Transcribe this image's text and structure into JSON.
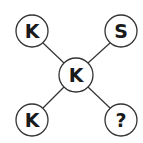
{
  "diagram": {
    "title": "",
    "nodes": [
      {
        "id": "top-left",
        "label": "K",
        "cx": 32,
        "cy": 31,
        "r": 16
      },
      {
        "id": "top-right",
        "label": "S",
        "cx": 121,
        "cy": 31,
        "r": 16
      },
      {
        "id": "center",
        "label": "K",
        "cx": 76,
        "cy": 75,
        "r": 17
      },
      {
        "id": "bottom-left",
        "label": "K",
        "cx": 32,
        "cy": 120,
        "r": 16
      },
      {
        "id": "bottom-right",
        "label": "?",
        "cx": 121,
        "cy": 120,
        "r": 16
      }
    ],
    "edges": [
      [
        "center",
        "top-left"
      ],
      [
        "center",
        "top-right"
      ],
      [
        "center",
        "bottom-left"
      ],
      [
        "center",
        "bottom-right"
      ]
    ],
    "colors": {
      "stroke": "#333333",
      "text": "#1a1a1a",
      "fill": "#ffffff"
    }
  }
}
